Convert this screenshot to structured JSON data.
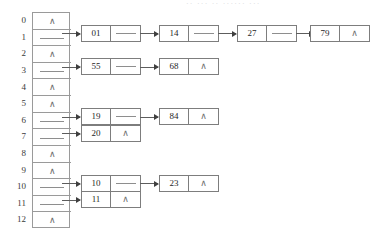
{
  "diagram": {
    "artifact_text": "·· ···  ··  ······ ···",
    "null_symbol": "∧",
    "colors": {
      "background": "#ffffff",
      "border": "#7d7d7d",
      "array_border": "#9a9a9a",
      "text": "#1f1f1f",
      "null_text": "#6e6e6e",
      "arrow": "#5d5d5d",
      "arrow_head": "#3f3f3f",
      "artifact": "#d8d8dc"
    },
    "index_labels": [
      "0",
      "1",
      "2",
      "3",
      "4",
      "5",
      "6",
      "7",
      "8",
      "9",
      "10",
      "11",
      "12"
    ],
    "buckets": [
      {
        "index": "0",
        "empty": true,
        "chain": []
      },
      {
        "index": "1",
        "empty": false,
        "chain": [
          "01",
          "14",
          "27",
          "79"
        ]
      },
      {
        "index": "2",
        "empty": true,
        "chain": []
      },
      {
        "index": "3",
        "empty": false,
        "chain": [
          "55",
          "68"
        ]
      },
      {
        "index": "4",
        "empty": true,
        "chain": []
      },
      {
        "index": "5",
        "empty": true,
        "chain": []
      },
      {
        "index": "6",
        "empty": false,
        "chain": [
          "19",
          "84"
        ]
      },
      {
        "index": "7",
        "empty": false,
        "chain": [
          "20"
        ]
      },
      {
        "index": "8",
        "empty": true,
        "chain": []
      },
      {
        "index": "9",
        "empty": true,
        "chain": []
      },
      {
        "index": "10",
        "empty": false,
        "chain": [
          "10",
          "23"
        ]
      },
      {
        "index": "11",
        "empty": false,
        "chain": [
          "11"
        ]
      },
      {
        "index": "12",
        "empty": true,
        "chain": []
      }
    ],
    "nodes": {
      "n1_0": "01",
      "n1_1": "14",
      "n1_2": "27",
      "n1_3": "79",
      "n3_0": "55",
      "n3_1": "68",
      "n6_0": "19",
      "n6_1": "84",
      "n7_0": "20",
      "n10_0": "10",
      "n10_1": "23",
      "n11_0": "11"
    }
  }
}
